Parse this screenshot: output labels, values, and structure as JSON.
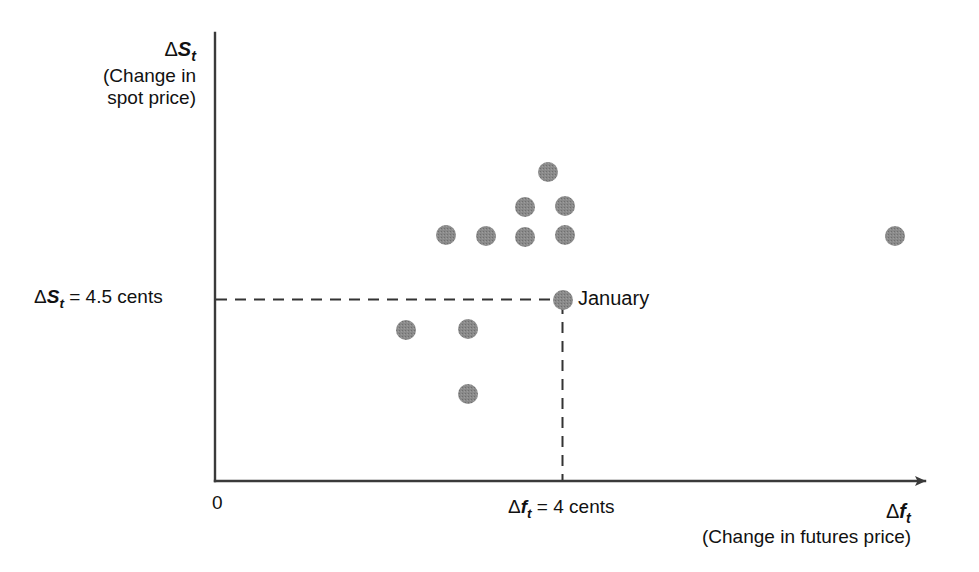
{
  "figure": {
    "background_color": "#ffffff",
    "axis_color": "#3a3a3a",
    "point_color": "#808080",
    "dash_color": "#333333"
  },
  "axes": {
    "y_axis": {
      "symbol_delta": "Δ",
      "symbol_var": "S",
      "symbol_sub": "t",
      "caption_line1": "(Change in",
      "caption_line2": "spot price)"
    },
    "x_axis": {
      "symbol_delta": "Δ",
      "symbol_var": "f",
      "symbol_sub": "t",
      "caption": "(Change in futures price)"
    },
    "origin_label": "0"
  },
  "annotations": {
    "y_reference": {
      "delta": "Δ",
      "var": "S",
      "sub": "t",
      "equals": " = 4.5 cents"
    },
    "x_reference": {
      "delta": "Δ",
      "var": "f",
      "sub": "t",
      "equals": " = 4 cents"
    },
    "highlight_point_label": "January"
  },
  "chart_data": {
    "type": "scatter",
    "title": "",
    "xlabel": "Δf_t (Change in futures price)",
    "ylabel": "ΔS_t (Change in spot price)",
    "xlim": [
      0,
      12
    ],
    "ylim": [
      0,
      10
    ],
    "grid": false,
    "legend": null,
    "reference_lines": [
      {
        "orientation": "horizontal",
        "value": 4.5,
        "label": "ΔS_t = 4.5 cents",
        "style": "dashed",
        "from_axis": "y"
      },
      {
        "orientation": "vertical",
        "value": 4.0,
        "label": "Δf_t = 4 cents",
        "style": "dashed",
        "from_axis": "x"
      }
    ],
    "points": [
      {
        "name": "p1",
        "px": 446,
        "py": 235,
        "x": 2.7,
        "y": 6.05
      },
      {
        "name": "p2",
        "px": 486,
        "py": 236,
        "x": 3.16,
        "y": 6.03
      },
      {
        "name": "p3",
        "px": 525,
        "py": 237,
        "x": 3.6,
        "y": 6.0
      },
      {
        "name": "p4",
        "px": 565,
        "py": 235,
        "x": 4.06,
        "y": 6.05
      },
      {
        "name": "p5",
        "px": 525,
        "py": 207,
        "x": 3.6,
        "y": 6.68
      },
      {
        "name": "p6",
        "px": 565,
        "py": 206,
        "x": 4.06,
        "y": 6.7
      },
      {
        "name": "p7",
        "px": 548,
        "py": 172,
        "x": 3.86,
        "y": 7.48
      },
      {
        "name": "january",
        "px": 563,
        "py": 300,
        "x": 4.0,
        "y": 4.5,
        "label": "January",
        "highlighted": true
      },
      {
        "name": "p9",
        "px": 406,
        "py": 330,
        "x": 2.24,
        "y": 3.81
      },
      {
        "name": "p10",
        "px": 468,
        "py": 329,
        "x": 2.95,
        "y": 3.83
      },
      {
        "name": "p11",
        "px": 468,
        "py": 394,
        "x": 2.95,
        "y": 2.35
      },
      {
        "name": "outlier",
        "px": 895,
        "py": 236,
        "x": 7.83,
        "y": 6.03
      }
    ],
    "point_radius_px": 10
  }
}
